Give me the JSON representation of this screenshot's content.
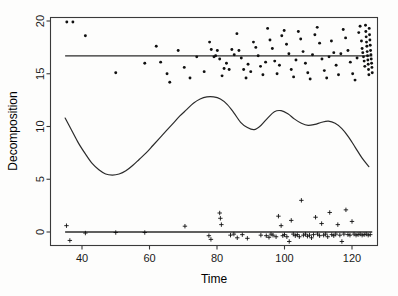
{
  "chart_data": {
    "type": "scatter",
    "title": "",
    "xlabel": "Time",
    "ylabel": "Decomposition",
    "xlim": [
      34,
      126
    ],
    "ylim": [
      -1.5,
      20.2
    ],
    "xticks": [
      40,
      60,
      80,
      100,
      120
    ],
    "yticks": [
      0,
      5,
      10,
      15,
      20
    ],
    "grid": false,
    "legend": "none",
    "series": [
      {
        "name": "observed",
        "marker": "dot",
        "points": [
          [
            35.5,
            19.9
          ],
          [
            37.3,
            19.9
          ],
          [
            41.0,
            18.6
          ],
          [
            50.0,
            15.1
          ],
          [
            58.6,
            16.0
          ],
          [
            62.0,
            17.6
          ],
          [
            63.3,
            16.1
          ],
          [
            65.2,
            15.0
          ],
          [
            66.0,
            14.2
          ],
          [
            68.5,
            17.2
          ],
          [
            70.3,
            15.6
          ],
          [
            72.0,
            14.6
          ],
          [
            74.0,
            16.6
          ],
          [
            76.2,
            15.2
          ],
          [
            77.8,
            18.0
          ],
          [
            78.3,
            17.3
          ],
          [
            79.1,
            16.6
          ],
          [
            79.6,
            16.7
          ],
          [
            80.1,
            17.2
          ],
          [
            80.8,
            16.4
          ],
          [
            81.5,
            14.8
          ],
          [
            82.1,
            15.5
          ],
          [
            82.8,
            16.0
          ],
          [
            83.6,
            15.4
          ],
          [
            84.4,
            17.3
          ],
          [
            85.1,
            16.8
          ],
          [
            85.9,
            18.8
          ],
          [
            86.5,
            17.2
          ],
          [
            87.2,
            16.5
          ],
          [
            87.9,
            15.4
          ],
          [
            88.6,
            14.6
          ],
          [
            89.2,
            15.9
          ],
          [
            90.0,
            15.2
          ],
          [
            90.8,
            18.0
          ],
          [
            91.5,
            17.5
          ],
          [
            92.2,
            16.7
          ],
          [
            92.9,
            15.7
          ],
          [
            93.6,
            14.9
          ],
          [
            94.4,
            16.1
          ],
          [
            95.0,
            19.3
          ],
          [
            95.7,
            18.2
          ],
          [
            96.4,
            17.4
          ],
          [
            97.1,
            16.2
          ],
          [
            97.8,
            15.0
          ],
          [
            98.5,
            15.8
          ],
          [
            99.2,
            18.6
          ],
          [
            99.9,
            19.1
          ],
          [
            100.6,
            17.8
          ],
          [
            101.3,
            16.9
          ],
          [
            102.0,
            15.4
          ],
          [
            102.7,
            14.7
          ],
          [
            103.4,
            16.3
          ],
          [
            104.1,
            19.0
          ],
          [
            104.8,
            18.3
          ],
          [
            105.5,
            17.1
          ],
          [
            106.2,
            16.0
          ],
          [
            106.9,
            15.1
          ],
          [
            107.6,
            14.5
          ],
          [
            108.3,
            16.8
          ],
          [
            109.0,
            18.7
          ],
          [
            109.7,
            19.4
          ],
          [
            110.4,
            17.9
          ],
          [
            111.1,
            16.4
          ],
          [
            111.8,
            15.3
          ],
          [
            112.5,
            14.6
          ],
          [
            113.2,
            16.6
          ],
          [
            113.9,
            18.1
          ],
          [
            114.6,
            17.0
          ],
          [
            115.3,
            15.8
          ],
          [
            116.0,
            14.9
          ],
          [
            116.7,
            16.9
          ],
          [
            117.4,
            19.2
          ],
          [
            118.1,
            18.4
          ],
          [
            118.8,
            17.2
          ],
          [
            119.5,
            16.1
          ],
          [
            120.2,
            15.0
          ],
          [
            120.9,
            14.4
          ],
          [
            121.5,
            16.5
          ],
          [
            122.0,
            18.9
          ],
          [
            122.4,
            19.5
          ],
          [
            122.8,
            18.1
          ],
          [
            123.0,
            17.4
          ],
          [
            123.2,
            17.0
          ],
          [
            123.4,
            16.6
          ],
          [
            123.6,
            16.2
          ],
          [
            123.8,
            15.7
          ],
          [
            124.0,
            19.6
          ],
          [
            124.1,
            19.0
          ],
          [
            124.2,
            18.5
          ],
          [
            124.3,
            18.0
          ],
          [
            124.4,
            17.6
          ],
          [
            124.5,
            17.1
          ],
          [
            124.6,
            16.7
          ],
          [
            124.7,
            16.3
          ],
          [
            124.8,
            15.9
          ],
          [
            124.9,
            15.4
          ],
          [
            125.0,
            14.9
          ],
          [
            125.1,
            19.3
          ],
          [
            125.2,
            18.7
          ],
          [
            125.3,
            18.2
          ],
          [
            125.4,
            17.7
          ],
          [
            125.5,
            17.2
          ],
          [
            125.6,
            16.8
          ],
          [
            125.7,
            16.4
          ],
          [
            125.8,
            16.0
          ],
          [
            125.9,
            15.6
          ],
          [
            126.0,
            15.1
          ]
        ]
      },
      {
        "name": "residuals",
        "marker": "cross",
        "points": [
          [
            35.4,
            0.6
          ],
          [
            36.4,
            -0.8
          ],
          [
            41.0,
            -0.1
          ],
          [
            50.0,
            -0.05
          ],
          [
            58.6,
            -0.05
          ],
          [
            70.5,
            0.55
          ],
          [
            77.6,
            -0.35
          ],
          [
            78.2,
            -0.7
          ],
          [
            80.8,
            1.8
          ],
          [
            81.0,
            1.3
          ],
          [
            81.3,
            0.7
          ],
          [
            84.0,
            -0.3
          ],
          [
            85.0,
            -0.2
          ],
          [
            86.0,
            -0.55
          ],
          [
            87.5,
            -0.25
          ],
          [
            89.0,
            -0.6
          ],
          [
            93.0,
            -0.3
          ],
          [
            94.6,
            -0.35
          ],
          [
            95.4,
            -0.5
          ],
          [
            96.0,
            -0.2
          ],
          [
            96.6,
            -0.3
          ],
          [
            97.5,
            -0.45
          ],
          [
            98.2,
            1.5
          ],
          [
            99.0,
            0.6
          ],
          [
            99.5,
            -0.35
          ],
          [
            100.0,
            -0.25
          ],
          [
            100.7,
            -0.45
          ],
          [
            101.4,
            -0.9
          ],
          [
            102.0,
            1.1
          ],
          [
            102.6,
            -0.2
          ],
          [
            103.2,
            -0.35
          ],
          [
            103.8,
            -0.25
          ],
          [
            104.4,
            -0.45
          ],
          [
            105.0,
            3.0
          ],
          [
            105.6,
            -0.3
          ],
          [
            106.2,
            -0.2
          ],
          [
            106.8,
            -0.4
          ],
          [
            107.4,
            -0.3
          ],
          [
            108.0,
            -0.55
          ],
          [
            108.6,
            -0.25
          ],
          [
            109.2,
            1.4
          ],
          [
            109.8,
            -0.2
          ],
          [
            110.4,
            -0.35
          ],
          [
            111.0,
            0.8
          ],
          [
            111.6,
            -0.3
          ],
          [
            112.2,
            -0.2
          ],
          [
            112.8,
            -0.45
          ],
          [
            113.4,
            1.85
          ],
          [
            114.0,
            -0.25
          ],
          [
            114.6,
            -0.35
          ],
          [
            115.2,
            -0.2
          ],
          [
            115.8,
            0.7
          ],
          [
            116.4,
            -0.3
          ],
          [
            117.0,
            -0.9
          ],
          [
            117.6,
            -0.2
          ],
          [
            118.2,
            2.1
          ],
          [
            118.8,
            -0.25
          ],
          [
            119.4,
            -0.3
          ],
          [
            120.0,
            1.0
          ],
          [
            120.6,
            -0.2
          ],
          [
            121.2,
            -0.3
          ],
          [
            121.8,
            -0.25
          ],
          [
            122.4,
            -0.2
          ],
          [
            123.0,
            -0.3
          ],
          [
            123.6,
            -0.25
          ],
          [
            124.2,
            -0.2
          ],
          [
            124.8,
            -0.3
          ],
          [
            125.4,
            -0.25
          ]
        ]
      }
    ],
    "reference_lines": [
      {
        "name": "observed-mean-line",
        "y": 16.7,
        "x_start": 35.0,
        "x_end": 126.0
      },
      {
        "name": "residual-zero-line",
        "y": 0.0,
        "x_start": 35.0,
        "x_end": 126.0
      }
    ],
    "trend_curve": {
      "name": "decomposition-trend",
      "points": [
        [
          35.0,
          10.8
        ],
        [
          37.0,
          9.6
        ],
        [
          39.0,
          8.4
        ],
        [
          41.0,
          7.4
        ],
        [
          43.0,
          6.5
        ],
        [
          45.0,
          5.9
        ],
        [
          47.0,
          5.5
        ],
        [
          49.0,
          5.4
        ],
        [
          51.0,
          5.5
        ],
        [
          53.0,
          5.8
        ],
        [
          55.0,
          6.3
        ],
        [
          57.0,
          6.9
        ],
        [
          59.0,
          7.5
        ],
        [
          61.0,
          8.2
        ],
        [
          63.0,
          8.9
        ],
        [
          65.0,
          9.6
        ],
        [
          67.0,
          10.3
        ],
        [
          69.0,
          11.0
        ],
        [
          71.0,
          11.6
        ],
        [
          73.0,
          12.2
        ],
        [
          75.0,
          12.6
        ],
        [
          77.0,
          12.8
        ],
        [
          79.0,
          12.8
        ],
        [
          81.0,
          12.6
        ],
        [
          83.0,
          12.1
        ],
        [
          85.0,
          11.3
        ],
        [
          87.0,
          10.4
        ],
        [
          89.0,
          9.9
        ],
        [
          91.0,
          9.7
        ],
        [
          93.0,
          10.1
        ],
        [
          95.0,
          10.8
        ],
        [
          97.0,
          11.4
        ],
        [
          99.0,
          11.5
        ],
        [
          101.0,
          11.2
        ],
        [
          103.0,
          10.7
        ],
        [
          105.0,
          10.3
        ],
        [
          107.0,
          10.1
        ],
        [
          109.0,
          10.2
        ],
        [
          111.0,
          10.4
        ],
        [
          113.0,
          10.5
        ],
        [
          115.0,
          10.3
        ],
        [
          117.0,
          9.8
        ],
        [
          119.0,
          9.0
        ],
        [
          121.0,
          8.0
        ],
        [
          123.0,
          7.0
        ],
        [
          125.0,
          6.2
        ]
      ]
    }
  },
  "axes": {
    "x_title": "Time",
    "y_title": "Decomposition",
    "x_tick_labels": [
      "40",
      "60",
      "80",
      "100",
      "120"
    ],
    "y_tick_labels": [
      "0",
      "5",
      "10",
      "15",
      "20"
    ]
  },
  "colors": {
    "frame": "#3a3a3a",
    "line": "#2b2b2b",
    "marker": "#101010",
    "background": "#fdfdfc"
  }
}
